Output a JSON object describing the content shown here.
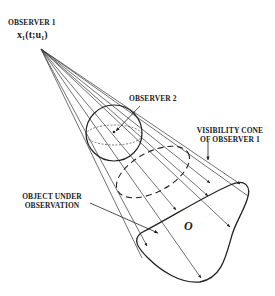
{
  "diagram": {
    "labels": {
      "observer1": "OBSERVER 1",
      "observer1_state": "x₁(t;u₁)",
      "observer2": "OBSERVER 2",
      "cone_line1": "VISIBILITY CONE",
      "cone_line2": "OF OBSERVER 1",
      "object_line1": "OBJECT UNDER",
      "object_line2": "OBSERVATION",
      "object_symbol": "O"
    },
    "colors": {
      "stroke": "#222222",
      "background": "#ffffff"
    }
  }
}
